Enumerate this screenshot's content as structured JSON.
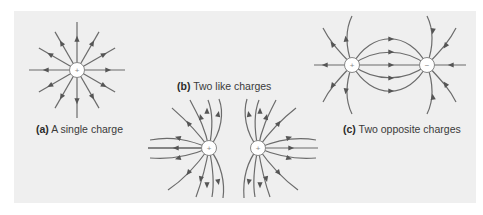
{
  "figure": {
    "background": "#efefef",
    "line_color": "#6b6b6b",
    "panels": [
      {
        "id": "a",
        "letter": "(a)",
        "caption": "A single charge",
        "charges": [
          {
            "sign": "+",
            "x": 77,
            "y": 70
          }
        ]
      },
      {
        "id": "b",
        "letter": "(b)",
        "caption": "Two like charges",
        "charges": [
          {
            "sign": "+",
            "x": 209,
            "y": 148
          },
          {
            "sign": "+",
            "x": 258,
            "y": 148
          }
        ]
      },
      {
        "id": "c",
        "letter": "(c)",
        "caption": "Two opposite charges",
        "charges": [
          {
            "sign": "+",
            "x": 352,
            "y": 65
          },
          {
            "sign": "−",
            "x": 427,
            "y": 65
          }
        ]
      }
    ]
  }
}
